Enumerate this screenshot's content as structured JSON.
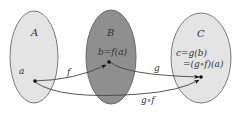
{
  "diagram": {
    "sets": [
      {
        "name": "A",
        "label": "A",
        "fill": "#e4e4e4",
        "stroke": "#7a7a7a"
      },
      {
        "name": "B",
        "label": "B",
        "fill": "#8f8f8f",
        "stroke": "#6a6a6a"
      },
      {
        "name": "C",
        "label": "C",
        "fill": "#e4e4e4",
        "stroke": "#7a7a7a"
      }
    ],
    "elements": {
      "a": "a",
      "b": "b=f(a)",
      "c_line1": "c=g(b)",
      "c_line2": "=(g∘f)(a)"
    },
    "mappings": [
      {
        "name": "f",
        "label": "f",
        "from": "a",
        "to": "b"
      },
      {
        "name": "g",
        "label": "g",
        "from": "b",
        "to": "c"
      },
      {
        "name": "g-compose-f",
        "label": "g∘f",
        "from": "a",
        "to": "c"
      }
    ],
    "colors": {
      "arrow": "#444444",
      "point": "#111111"
    }
  }
}
